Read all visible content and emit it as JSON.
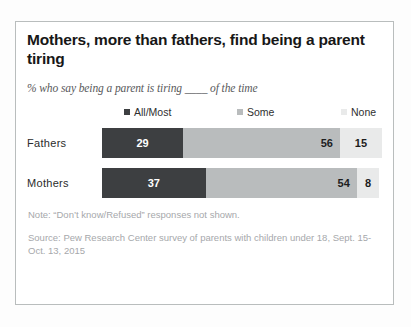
{
  "card": {
    "title": "Mothers, more than fathers, find being a parent tiring",
    "subtitle": "% who say being a parent is tiring ____ of the time",
    "note": "Note: “Don’t know/Refused” responses not shown.",
    "source": "Source: Pew Research Center survey of parents with children under 18, Sept. 15-Oct. 13, 2015"
  },
  "colors": {
    "all_most": "#3d3f41",
    "some": "#b9bcbd",
    "none": "#e9eaea",
    "card_border": "#b9bdbd",
    "title_text": "#171717",
    "subtitle_text": "#58595b",
    "footnote_text": "#a6a8ab"
  },
  "legend": [
    {
      "label": "All/Most",
      "color": "#3d3f41"
    },
    {
      "label": "Some",
      "color": "#b9bcbd"
    },
    {
      "label": "None",
      "color": "#e9eaea"
    }
  ],
  "chart_data": {
    "type": "bar",
    "orientation": "horizontal",
    "stacked": true,
    "stacked_100": true,
    "title": "Mothers, more than fathers, find being a parent tiring",
    "subtitle": "% who say being a parent is tiring ____ of the time",
    "xlabel": "",
    "ylabel": "",
    "xlim": [
      0,
      100
    ],
    "grid": false,
    "legend_position": "top",
    "categories": [
      "Fathers",
      "Mothers"
    ],
    "series": [
      {
        "name": "All/Most",
        "color": "#3d3f41",
        "values": [
          29,
          37
        ]
      },
      {
        "name": "Some",
        "color": "#b9bcbd",
        "values": [
          56,
          54
        ]
      },
      {
        "name": "None",
        "color": "#e9eaea",
        "values": [
          15,
          8
        ]
      }
    ],
    "rows": [
      {
        "category": "Fathers",
        "segments": [
          {
            "name": "All/Most",
            "value": 29,
            "label": "29",
            "color": "#3d3f41"
          },
          {
            "name": "Some",
            "value": 56,
            "label": "56",
            "color": "#b9bcbd"
          },
          {
            "name": "None",
            "value": 15,
            "label": "15",
            "color": "#e9eaea"
          }
        ]
      },
      {
        "category": "Mothers",
        "segments": [
          {
            "name": "All/Most",
            "value": 37,
            "label": "37",
            "color": "#3d3f41"
          },
          {
            "name": "Some",
            "value": 54,
            "label": "54",
            "color": "#b9bcbd"
          },
          {
            "name": "None",
            "value": 8,
            "label": "8",
            "color": "#e9eaea"
          }
        ]
      }
    ],
    "note": "Note: “Don’t know/Refused” responses not shown.",
    "source": "Source: Pew Research Center survey of parents with children under 18, Sept. 15-Oct. 13, 2015"
  }
}
